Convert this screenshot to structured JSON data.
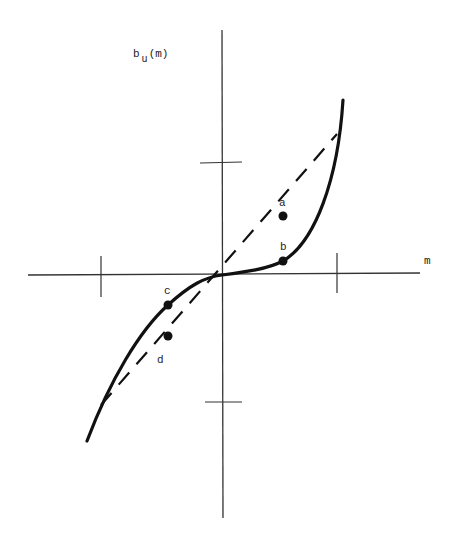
{
  "figure": {
    "y_axis_label": {
      "main": "b",
      "sub": "u",
      "tail": "(m)"
    },
    "x_axis_label": "m",
    "points": [
      {
        "id": "a",
        "label": "a",
        "x": 283,
        "y": 216,
        "label_x": 283,
        "label_y": 206
      },
      {
        "id": "b",
        "label": "b",
        "x": 283,
        "y": 261,
        "label_x": 284,
        "label_y": 250
      },
      {
        "id": "c",
        "label": "c",
        "x": 168,
        "y": 305,
        "label_x": 168,
        "label_y": 294
      },
      {
        "id": "d",
        "label": "d",
        "x": 168,
        "y": 336,
        "label_x": 161,
        "label_y": 363
      }
    ],
    "curves": {
      "solid": "cubic-like nonlinear curve b_u(m), steep at extremes, flat near origin",
      "dashed": "straight line through origin"
    },
    "colors": {
      "ink": "#111111",
      "axis": "#333333",
      "background": "#ffffff"
    }
  }
}
